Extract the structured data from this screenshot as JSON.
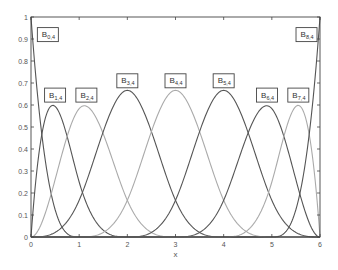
{
  "chart_data": {
    "type": "line",
    "title": "",
    "xlabel": "x",
    "ylabel": "",
    "xlim": [
      0,
      6
    ],
    "ylim": [
      0,
      1
    ],
    "grid": false,
    "knots": [
      0,
      0,
      0,
      0,
      1,
      2,
      3,
      4,
      5,
      6,
      6,
      6,
      6
    ],
    "degree": 3,
    "xticks": [
      "0",
      "1",
      "2",
      "3",
      "4",
      "5",
      "6"
    ],
    "yticks": [
      "0",
      "0.1",
      "0.2",
      "0.3",
      "0.4",
      "0.5",
      "0.6",
      "0.7",
      "0.8",
      "0.9",
      "1"
    ],
    "series": [
      {
        "name": "B0,4",
        "base": "B",
        "sub": "0,4",
        "color": "#555555",
        "peak_x": 0,
        "peak_y": 1.0,
        "label_x": 0.35,
        "label_y": 0.92
      },
      {
        "name": "B1,4",
        "base": "B",
        "sub": "1,4",
        "color": "#555555",
        "peak_x": 0.5,
        "peak_y": 0.6,
        "label_x": 0.5,
        "label_y": 0.645
      },
      {
        "name": "B2,4",
        "base": "B",
        "sub": "2,4",
        "color": "#aaaaaa",
        "peak_x": 1.1,
        "peak_y": 0.6,
        "label_x": 1.15,
        "label_y": 0.645
      },
      {
        "name": "B3,4",
        "base": "B",
        "sub": "3,4",
        "color": "#555555",
        "peak_x": 2,
        "peak_y": 0.667,
        "label_x": 2,
        "label_y": 0.71
      },
      {
        "name": "B4,4",
        "base": "B",
        "sub": "4,4",
        "color": "#aaaaaa",
        "peak_x": 3,
        "peak_y": 0.667,
        "label_x": 3,
        "label_y": 0.71
      },
      {
        "name": "B5,4",
        "base": "B",
        "sub": "5,4",
        "color": "#555555",
        "peak_x": 4,
        "peak_y": 0.667,
        "label_x": 4,
        "label_y": 0.71
      },
      {
        "name": "B6,4",
        "base": "B",
        "sub": "6,4",
        "color": "#555555",
        "peak_x": 4.9,
        "peak_y": 0.6,
        "label_x": 4.9,
        "label_y": 0.645
      },
      {
        "name": "B7,4",
        "base": "B",
        "sub": "7,4",
        "color": "#aaaaaa",
        "peak_x": 5.5,
        "peak_y": 0.6,
        "label_x": 5.55,
        "label_y": 0.645
      },
      {
        "name": "B8,4",
        "base": "B",
        "sub": "8,4",
        "color": "#555555",
        "peak_x": 6,
        "peak_y": 1.0,
        "label_x": 5.72,
        "label_y": 0.92
      }
    ]
  },
  "layout": {
    "plot_left": 31,
    "plot_top": 17,
    "plot_right": 320,
    "plot_bottom": 237
  }
}
